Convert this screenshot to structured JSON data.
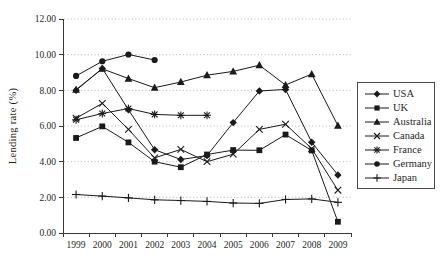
{
  "chart_data": {
    "type": "line",
    "title": "",
    "xlabel": "",
    "ylabel": "Lending rate (%)",
    "ylim": [
      0,
      12
    ],
    "y_ticks": [
      0,
      2,
      4,
      6,
      8,
      10,
      12
    ],
    "y_tick_labels": [
      "0.00",
      "2.00",
      "4.00",
      "6.00",
      "8.00",
      "10.00",
      "12.00"
    ],
    "categories": [
      "1999",
      "2000",
      "2001",
      "2002",
      "2003",
      "2004",
      "2005",
      "2006",
      "2007",
      "2008",
      "2009"
    ],
    "grid": "horizontal-dotted",
    "legend_position": "right",
    "colors": {
      "line": "#1a1a1a",
      "grid": "#b6b6b6",
      "text": "#1f1f1f",
      "axis": "#3a3a3a",
      "legend_border": "#4a4a4a"
    },
    "series": [
      {
        "name": "USA",
        "marker": "diamond",
        "values": [
          8.0,
          9.23,
          6.91,
          4.67,
          4.12,
          4.34,
          6.19,
          7.96,
          8.05,
          5.09,
          3.25
        ]
      },
      {
        "name": "UK",
        "marker": "square",
        "values": [
          5.33,
          5.98,
          5.08,
          4.0,
          3.69,
          4.4,
          4.65,
          4.64,
          5.52,
          4.63,
          0.63
        ]
      },
      {
        "name": "Australia",
        "marker": "triangle",
        "values": [
          8.04,
          9.21,
          8.66,
          8.15,
          8.47,
          8.85,
          9.06,
          9.41,
          8.3,
          8.91,
          6.02
        ]
      },
      {
        "name": "Canada",
        "marker": "x",
        "values": [
          6.44,
          7.27,
          5.81,
          4.21,
          4.69,
          4.0,
          4.42,
          5.81,
          6.1,
          4.73,
          2.4
        ]
      },
      {
        "name": "France",
        "marker": "asterisk",
        "values": [
          6.35,
          6.7,
          6.98,
          6.65,
          6.6,
          6.6,
          null,
          null,
          null,
          null,
          null
        ]
      },
      {
        "name": "Germany",
        "marker": "circle",
        "values": [
          8.81,
          9.63,
          10.01,
          9.7,
          null,
          null,
          null,
          null,
          null,
          null,
          null
        ]
      },
      {
        "name": "Japan",
        "marker": "plus",
        "values": [
          2.16,
          2.07,
          1.97,
          1.86,
          1.82,
          1.77,
          1.68,
          1.66,
          1.88,
          1.91,
          1.72
        ]
      }
    ]
  }
}
